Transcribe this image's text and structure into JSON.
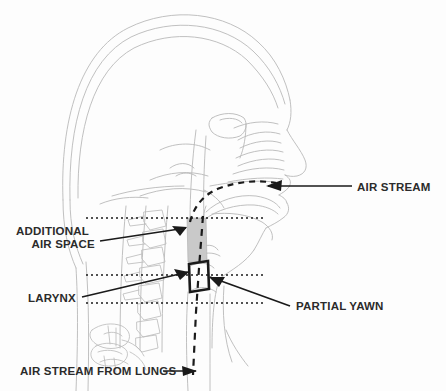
{
  "figure": {
    "background_color": "#fdfdfd",
    "anatomy_line_color": "#b9b9b9",
    "ink_color": "#1a1a1a",
    "air_space_fill": "#c9c9c9"
  },
  "labels": {
    "air_stream": "AIR STREAM",
    "additional_air_space_line1": "ADDITIONAL",
    "additional_air_space_line2": "AIR SPACE",
    "larynx": "LARYNX",
    "partial_yawn": "PARTIAL YAWN",
    "air_stream_from_lungs": "AIR STREAM FROM LUNGS"
  },
  "annotations": {
    "air_stream_arrow_direction": "left",
    "additional_air_space_arrow_direction": "right",
    "larynx_arrow_direction": "right",
    "partial_yawn_arrow_direction": "left",
    "air_stream_from_lungs_arrow_direction": "right",
    "guide_lines": [
      {
        "name": "upper-guide-line",
        "y": 218
      },
      {
        "name": "middle-guide-line",
        "y": 275
      },
      {
        "name": "lower-guide-line",
        "y": 303
      }
    ],
    "airflow_paths": [
      {
        "name": "oral-air-stream",
        "style": "dashed"
      },
      {
        "name": "tracheal-air-stream",
        "style": "dashed-vertical"
      }
    ]
  }
}
